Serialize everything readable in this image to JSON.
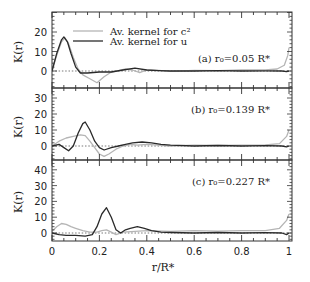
{
  "chart_data": {
    "type": "line",
    "xlabel": "r/R*",
    "ylabel": "K(r)",
    "xlim": [
      0,
      1
    ],
    "x_ticks": [
      "0",
      "0.2",
      "0.4",
      "0.6",
      "0.8",
      "1"
    ],
    "legend": {
      "position": "upper right of panel (a)",
      "entries": [
        {
          "label": "Av. kernel for c²",
          "style": "light gray line",
          "color": "#b5b5b5"
        },
        {
          "label": "Av. kernel for u",
          "style": "dark line",
          "color": "#2a2a2a"
        }
      ]
    },
    "panels": [
      {
        "id": "a",
        "annotation": "(a) r₀=0.05 R*",
        "r0": 0.05,
        "ylim": [
          -9,
          30
        ],
        "y_ticks": [
          "0",
          "10",
          "20"
        ],
        "zero_line": "dotted",
        "series": [
          {
            "name": "Av. kernel for c²",
            "x": [
              0,
              0.02,
              0.04,
              0.055,
              0.07,
              0.09,
              0.11,
              0.13,
              0.16,
              0.19,
              0.22,
              0.25,
              0.28,
              0.31,
              0.34,
              0.37,
              0.4,
              0.45,
              0.5,
              0.6,
              0.7,
              0.8,
              0.9,
              0.95,
              0.98,
              0.995,
              1
            ],
            "y": [
              0,
              8,
              15,
              17,
              14,
              7,
              1,
              -2,
              -4,
              -6,
              -3,
              -0.5,
              0.2,
              1,
              0.5,
              -0.8,
              0.5,
              0.3,
              -0.2,
              0.3,
              0.2,
              0.5,
              0.6,
              1,
              3,
              8,
              12
            ]
          },
          {
            "name": "Av. kernel for u",
            "x": [
              0,
              0.02,
              0.04,
              0.05,
              0.065,
              0.08,
              0.1,
              0.12,
              0.15,
              0.2,
              0.25,
              0.3,
              0.35,
              0.4,
              0.45,
              0.5,
              0.6,
              0.7,
              0.8,
              0.9,
              0.97,
              0.99,
              1
            ],
            "y": [
              0,
              9,
              16,
              17.5,
              15,
              9,
              2,
              -1,
              -1,
              -0.5,
              -0.5,
              0.5,
              1.5,
              0.5,
              0.2,
              0,
              0,
              0.2,
              0,
              0.1,
              0,
              -0.3,
              0
            ]
          }
        ]
      },
      {
        "id": "b",
        "annotation": "(b) r₀=0.139 R*",
        "r0": 0.139,
        "ylim": [
          -9,
          36
        ],
        "y_ticks": [
          "0",
          "10",
          "20",
          "30"
        ],
        "zero_line": "dotted",
        "series": [
          {
            "name": "Av. kernel for c²",
            "x": [
              0,
              0.03,
              0.06,
              0.09,
              0.12,
              0.14,
              0.16,
              0.18,
              0.2,
              0.22,
              0.24,
              0.27,
              0.3,
              0.33,
              0.36,
              0.4,
              0.45,
              0.5,
              0.6,
              0.7,
              0.8,
              0.9,
              0.96,
              0.99,
              1
            ],
            "y": [
              0,
              3,
              5,
              6,
              7,
              6.5,
              3,
              -1,
              -5,
              -6.5,
              -5,
              -2,
              0,
              1,
              0.5,
              1,
              0.5,
              0,
              0.5,
              0.3,
              0.5,
              0.6,
              1.5,
              6,
              10
            ]
          },
          {
            "name": "Av. kernel for u",
            "x": [
              0,
              0.03,
              0.05,
              0.07,
              0.09,
              0.11,
              0.13,
              0.14,
              0.16,
              0.18,
              0.2,
              0.22,
              0.25,
              0.28,
              0.31,
              0.34,
              0.38,
              0.42,
              0.46,
              0.5,
              0.6,
              0.7,
              0.8,
              0.9,
              0.97,
              0.99,
              1
            ],
            "y": [
              0,
              1,
              -1,
              -3,
              0,
              8,
              14,
              15,
              10,
              3,
              -1,
              -2.5,
              -1,
              0,
              1,
              2,
              2.5,
              2,
              1,
              0.5,
              0,
              0.3,
              0,
              0.2,
              0,
              -0.5,
              0
            ]
          }
        ]
      },
      {
        "id": "c",
        "annotation": "(c) r₀=0.227 R*",
        "r0": 0.227,
        "ylim": [
          -5,
          46
        ],
        "y_ticks": [
          "0",
          "10",
          "20",
          "30",
          "40"
        ],
        "zero_line": "dotted",
        "series": [
          {
            "name": "Av. kernel for c²",
            "x": [
              0,
              0.02,
              0.04,
              0.06,
              0.08,
              0.1,
              0.13,
              0.16,
              0.19,
              0.21,
              0.23,
              0.25,
              0.27,
              0.3,
              0.35,
              0.4,
              0.5,
              0.6,
              0.7,
              0.8,
              0.9,
              0.96,
              0.99,
              1
            ],
            "y": [
              1,
              4,
              6,
              5.5,
              4,
              3,
              1.5,
              0.5,
              0.5,
              1.5,
              2,
              0.5,
              -1,
              0.5,
              1,
              1.5,
              1,
              1.5,
              1.2,
              1.5,
              1.5,
              3,
              8,
              12
            ]
          },
          {
            "name": "Av. kernel for u",
            "x": [
              0,
              0.03,
              0.06,
              0.1,
              0.14,
              0.17,
              0.19,
              0.21,
              0.23,
              0.25,
              0.27,
              0.29,
              0.31,
              0.33,
              0.36,
              0.39,
              0.42,
              0.46,
              0.5,
              0.6,
              0.7,
              0.8,
              0.9,
              0.97,
              0.99,
              1
            ],
            "y": [
              0,
              -1,
              -1.5,
              -1.5,
              -2,
              -1,
              4,
              12,
              16,
              10,
              2,
              0,
              2,
              3,
              4,
              3,
              1.5,
              0.5,
              0.3,
              0,
              0.3,
              0,
              0.2,
              0,
              -1,
              0
            ]
          }
        ]
      }
    ],
    "grid": false
  }
}
